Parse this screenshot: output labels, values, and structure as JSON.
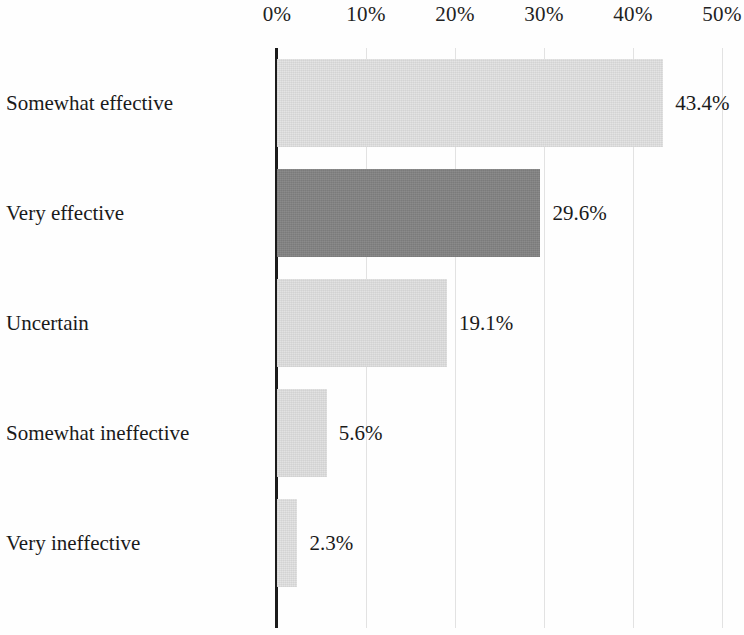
{
  "chart_data": {
    "type": "bar",
    "orientation": "horizontal",
    "title": "",
    "xlabel": "",
    "ylabel": "",
    "xlim": [
      0,
      50
    ],
    "grid": true,
    "legend": null,
    "x_tick_labels": [
      "0%",
      "10%",
      "20%",
      "30%",
      "40%",
      "50%"
    ],
    "x_ticks": [
      0,
      10,
      20,
      30,
      40,
      50
    ],
    "categories": [
      "Somewhat effective",
      "Very effective",
      "Uncertain",
      "Somewhat ineffective",
      "Very ineffective"
    ],
    "values": [
      43.4,
      29.6,
      19.1,
      5.6,
      2.3
    ],
    "value_labels": [
      "43.4%",
      "29.6%",
      "19.1%",
      "5.6%",
      "2.3%"
    ],
    "bar_colors": [
      "#e2e2e2",
      "#848484",
      "#e0e0e0",
      "#e0e0e0",
      "#e2e2e2"
    ],
    "highlight_index": 1,
    "colors": {
      "bar_light": "#e2e2e2",
      "bar_highlight": "#848484",
      "axis": "#1b1b1b",
      "gridline": "#d8d8d8",
      "text": "#1a1a1a",
      "background": "#fefefe"
    }
  }
}
